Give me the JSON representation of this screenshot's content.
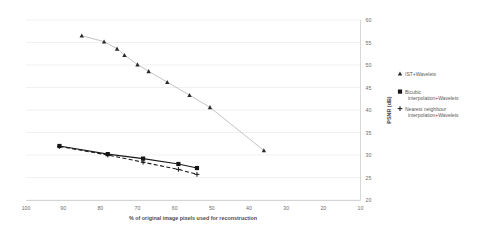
{
  "chart_data": {
    "type": "line",
    "title": "",
    "xlabel": "% of original image pixels used for reconstruction",
    "ylabel": "PSNR (dB)",
    "xlim": [
      100,
      10
    ],
    "ylim": [
      20,
      60
    ],
    "x_ticks": [
      100,
      90,
      80,
      70,
      60,
      50,
      40,
      30,
      20,
      10
    ],
    "y_ticks": [
      20,
      25,
      30,
      35,
      40,
      45,
      50,
      55,
      60
    ],
    "x_axis_reversed": true,
    "grid": "horizontal",
    "legend_position": "right",
    "series": [
      {
        "name": "IST+Wavelets",
        "marker": "triangle",
        "line_style": "solid",
        "color": "#9a9a9a",
        "points": [
          [
            85.0,
            56.5
          ],
          [
            79.0,
            55.2
          ],
          [
            75.5,
            53.6
          ],
          [
            73.5,
            52.2
          ],
          [
            70.0,
            50.1
          ],
          [
            67.0,
            48.6
          ],
          [
            62.0,
            46.2
          ],
          [
            56.0,
            43.3
          ],
          [
            50.5,
            40.6
          ],
          [
            36.0,
            31.0
          ]
        ]
      },
      {
        "name": "Bicubic interpolation+Wavelets",
        "marker": "square",
        "line_style": "solid",
        "color": "#151515",
        "points": [
          [
            91.0,
            32.0
          ],
          [
            78.0,
            30.2
          ],
          [
            68.5,
            29.2
          ],
          [
            59.0,
            28.0
          ],
          [
            54.0,
            27.1
          ]
        ]
      },
      {
        "name": "Nearest neighbour interpolation+Wavelets",
        "marker": "plus",
        "line_style": "dashed",
        "color": "#151515",
        "points": [
          [
            91.0,
            31.9
          ],
          [
            78.0,
            30.0
          ],
          [
            68.5,
            28.4
          ],
          [
            59.0,
            26.8
          ],
          [
            54.0,
            25.7
          ]
        ]
      }
    ]
  },
  "legend": {
    "items": [
      {
        "label": "IST+Wavelets",
        "marker": "triangle"
      },
      {
        "label": "Bicubic",
        "label2": "interpolation+Wavelets",
        "marker": "square"
      },
      {
        "label": "Nearest neighbour",
        "label2": "interpolation+Wavelets",
        "marker": "plus"
      }
    ]
  }
}
